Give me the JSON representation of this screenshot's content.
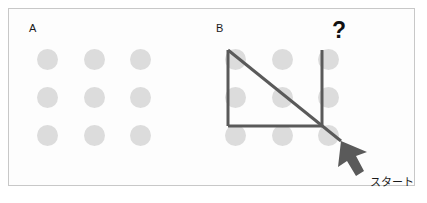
{
  "figure": {
    "background_color": "#fdfdfd",
    "border_color": "#c8c8c8",
    "dot_color": "#dcdcdc",
    "stroke_color": "#5a5a5a",
    "arrow_color": "#5a5a5a",
    "text_color": "#1a1a1a"
  },
  "panels": [
    {
      "id": "a",
      "label": "A",
      "grid": {
        "rows": 3,
        "cols": 3,
        "dot_count": 9
      },
      "has_path": false
    },
    {
      "id": "b",
      "label": "B",
      "grid": {
        "rows": 3,
        "cols": 3,
        "dot_count": 9
      },
      "has_path": true
    }
  ],
  "annotations": {
    "question_mark": "?",
    "start_label": "スタート"
  },
  "path": {
    "stroke_width": 3,
    "segments": [
      {
        "name": "left-vertical",
        "from": [
          228,
          50
        ],
        "to": [
          228,
          126
        ]
      },
      {
        "name": "bottom-horizontal",
        "from": [
          228,
          126
        ],
        "to": [
          322,
          126
        ]
      },
      {
        "name": "diagonal",
        "from": [
          228,
          50
        ],
        "to": [
          341,
          141
        ]
      },
      {
        "name": "right-vertical",
        "from": [
          322,
          50
        ],
        "to": [
          322,
          126
        ]
      }
    ]
  },
  "cursor": {
    "name": "arrow-pointer",
    "tip": [
      341,
      141
    ],
    "direction": "up-left"
  }
}
